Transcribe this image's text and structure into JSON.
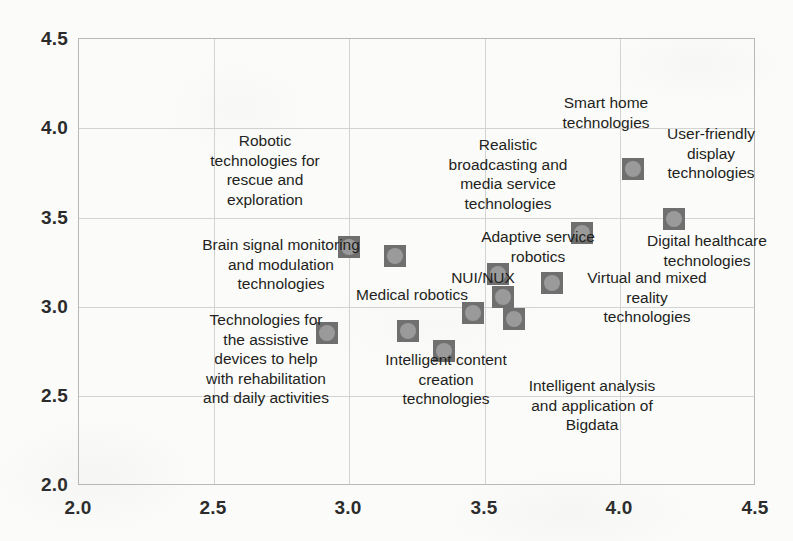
{
  "chart_data": {
    "type": "scatter",
    "title": "",
    "xlabel": "",
    "ylabel": "",
    "xlim": [
      2.0,
      4.5
    ],
    "ylim": [
      2.0,
      4.5
    ],
    "grid": true,
    "legend": "none",
    "xticks": [
      "2.0",
      "2.5",
      "3.0",
      "3.5",
      "4.0",
      "4.5"
    ],
    "yticks": [
      "2.0",
      "2.5",
      "3.0",
      "3.5",
      "4.0",
      "4.5"
    ],
    "marker_color": "#6f6f6f",
    "marker_inner_color": "#9a9a9a",
    "grid_color": "#d3d3d3",
    "border_color": "#b9b9b9",
    "text_color": "#231f20",
    "points": [
      {
        "label": "Brain signal monitoring\nand modulation\ntechnologies",
        "x": 3.0,
        "y": 3.33
      },
      {
        "label": "Robotic\ntechnologies for\nrescue and\nexploration",
        "x": 3.17,
        "y": 3.28
      },
      {
        "label": "Technologies for\nthe assistive\ndevices to help\nwith rehabilitation\nand daily activities",
        "x": 2.92,
        "y": 2.85
      },
      {
        "label": "Medical robotics",
        "x": 3.22,
        "y": 2.86
      },
      {
        "label": "Intelligent content\ncreation\ntechnologies",
        "x": 3.35,
        "y": 2.75
      },
      {
        "label": "NUI/NUX",
        "x": 3.46,
        "y": 2.96
      },
      {
        "label": "",
        "x": 3.55,
        "y": 3.18
      },
      {
        "label": "",
        "x": 3.57,
        "y": 3.05
      },
      {
        "label": "Intelligent analysis\nand application of\nBigdata",
        "x": 3.61,
        "y": 2.93
      },
      {
        "label": "Adaptive service\nrobotics",
        "x": 3.86,
        "y": 3.41
      },
      {
        "label": "Virtual and mixed\nreality\ntechnologies",
        "x": 3.75,
        "y": 3.13
      },
      {
        "label": "Realistic\nbroadcasting and\nmedia service\ntechnologies",
        "x": 3.55,
        "y": 3.18
      },
      {
        "label": "Smart home\ntechnologies",
        "x": 4.05,
        "y": 3.77
      },
      {
        "label": "User-friendly\ndisplay\ntechnologies",
        "x": 4.05,
        "y": 3.77
      },
      {
        "label": "Digital healthcare\ntechnologies",
        "x": 4.2,
        "y": 3.49
      }
    ],
    "markers": [
      {
        "name": "brain-signal-monitoring",
        "x": 3.0,
        "y": 3.33
      },
      {
        "name": "robotic-rescue-exploration",
        "x": 3.17,
        "y": 3.28
      },
      {
        "name": "assistive-rehabilitation-devices",
        "x": 2.92,
        "y": 2.85
      },
      {
        "name": "medical-robotics",
        "x": 3.22,
        "y": 2.86
      },
      {
        "name": "intelligent-content-creation",
        "x": 3.35,
        "y": 2.75
      },
      {
        "name": "nui-nux",
        "x": 3.46,
        "y": 2.96
      },
      {
        "name": "realistic-broadcasting-media",
        "x": 3.55,
        "y": 3.18
      },
      {
        "name": "adaptive-service-robotics-lower",
        "x": 3.57,
        "y": 3.05
      },
      {
        "name": "intelligent-analysis-bigdata",
        "x": 3.61,
        "y": 2.93
      },
      {
        "name": "adaptive-service-robotics",
        "x": 3.86,
        "y": 3.41
      },
      {
        "name": "virtual-mixed-reality",
        "x": 3.75,
        "y": 3.13
      },
      {
        "name": "smart-home-user-friendly-display",
        "x": 4.05,
        "y": 3.77
      },
      {
        "name": "digital-healthcare",
        "x": 4.2,
        "y": 3.49
      }
    ],
    "text_labels": [
      {
        "name": "robotic-rescue-exploration",
        "text": "Robotic\ntechnologies for\nrescue and\nexploration",
        "left": 180,
        "top": 131,
        "width": 170
      },
      {
        "name": "brain-signal-monitoring",
        "text": "Brain signal monitoring\nand modulation\ntechnologies",
        "left": 186,
        "top": 235,
        "width": 190
      },
      {
        "name": "assistive-rehabilitation-devices",
        "text": "Technologies for\nthe assistive\ndevices to help\nwith rehabilitation\nand daily activities",
        "left": 172,
        "top": 310,
        "width": 188
      },
      {
        "name": "medical-robotics",
        "text": "Medical robotics",
        "left": 342,
        "top": 285,
        "width": 140
      },
      {
        "name": "intelligent-content-creation",
        "text": "Intelligent content\ncreation\ntechnologies",
        "left": 366,
        "top": 350,
        "width": 160
      },
      {
        "name": "nui-nux",
        "text": "NUI/NUX",
        "left": 438,
        "top": 268,
        "width": 90
      },
      {
        "name": "realistic-broadcasting-media",
        "text": "Realistic\nbroadcasting and\nmedia service\ntechnologies",
        "left": 424,
        "top": 135,
        "width": 168
      },
      {
        "name": "adaptive-service-robotics",
        "text": "Adaptive service\nrobotics",
        "left": 462,
        "top": 227,
        "width": 152
      },
      {
        "name": "smart-home",
        "text": "Smart home\ntechnologies",
        "left": 542,
        "top": 93,
        "width": 128
      },
      {
        "name": "user-friendly-display",
        "text": "User-friendly\ndisplay\ntechnologies",
        "left": 646,
        "top": 124,
        "width": 130
      },
      {
        "name": "digital-healthcare",
        "text": "Digital healthcare\ntechnologies",
        "left": 628,
        "top": 231,
        "width": 158
      },
      {
        "name": "virtual-mixed-reality",
        "text": "Virtual and mixed\nreality\ntechnologies",
        "left": 566,
        "top": 268,
        "width": 162
      },
      {
        "name": "intelligent-analysis-bigdata",
        "text": "Intelligent analysis\nand application of\nBigdata",
        "left": 508,
        "top": 376,
        "width": 168
      }
    ]
  }
}
